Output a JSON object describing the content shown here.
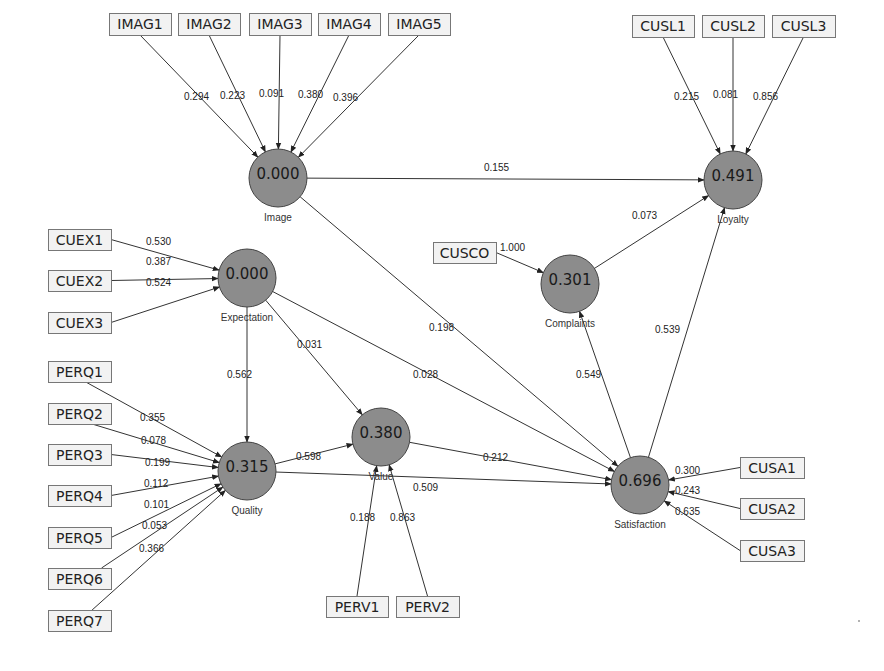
{
  "diagram": {
    "type": "PLS path model",
    "constructs": [
      {
        "id": "image",
        "label": "Image",
        "value": "0.000",
        "cx": 278,
        "cy": 178
      },
      {
        "id": "expectation",
        "label": "Expectation",
        "value": "0.000",
        "cx": 247,
        "cy": 278
      },
      {
        "id": "quality",
        "label": "Quality",
        "value": "0.315",
        "cx": 247,
        "cy": 471
      },
      {
        "id": "value",
        "label": "Value",
        "value": "0.380",
        "cx": 381,
        "cy": 437
      },
      {
        "id": "complaints",
        "label": "Complaints",
        "value": "0.301",
        "cx": 570,
        "cy": 284
      },
      {
        "id": "loyalty",
        "label": "Loyalty",
        "value": "0.491",
        "cx": 733,
        "cy": 180
      },
      {
        "id": "satisfaction",
        "label": "Satisfaction",
        "value": "0.696",
        "cx": 640,
        "cy": 485
      }
    ],
    "indicators": [
      {
        "id": "IMAG1",
        "label": "IMAG1",
        "x": 109,
        "y": 13,
        "w": 62,
        "h": 22,
        "construct": "image",
        "weight": "0.294",
        "lx": 184,
        "ly": 100
      },
      {
        "id": "IMAG2",
        "label": "IMAG2",
        "x": 178,
        "y": 13,
        "w": 62,
        "h": 22,
        "construct": "image",
        "weight": "0.223",
        "lx": 220,
        "ly": 99
      },
      {
        "id": "IMAG3",
        "label": "IMAG3",
        "x": 249,
        "y": 13,
        "w": 62,
        "h": 22,
        "construct": "image",
        "weight": "0.091",
        "lx": 259,
        "ly": 97
      },
      {
        "id": "IMAG4",
        "label": "IMAG4",
        "x": 318,
        "y": 13,
        "w": 62,
        "h": 22,
        "construct": "image",
        "weight": "0.380",
        "lx": 298,
        "ly": 98
      },
      {
        "id": "IMAG5",
        "label": "IMAG5",
        "x": 388,
        "y": 13,
        "w": 62,
        "h": 22,
        "construct": "image",
        "weight": "0.396",
        "lx": 333,
        "ly": 101
      },
      {
        "id": "CUSL1",
        "label": "CUSL1",
        "x": 632,
        "y": 15,
        "w": 62,
        "h": 22,
        "construct": "loyalty",
        "weight": "0.215",
        "lx": 674,
        "ly": 100
      },
      {
        "id": "CUSL2",
        "label": "CUSL2",
        "x": 702,
        "y": 15,
        "w": 62,
        "h": 22,
        "construct": "loyalty",
        "weight": "0.081",
        "lx": 713,
        "ly": 98
      },
      {
        "id": "CUSL3",
        "label": "CUSL3",
        "x": 772,
        "y": 15,
        "w": 63,
        "h": 22,
        "construct": "loyalty",
        "weight": "0.856",
        "lx": 753,
        "ly": 100
      },
      {
        "id": "CUEX1",
        "label": "CUEX1",
        "x": 48,
        "y": 229,
        "w": 63,
        "h": 21,
        "construct": "expectation",
        "weight": "0.530",
        "lx": 146,
        "ly": 245
      },
      {
        "id": "CUEX2",
        "label": "CUEX2",
        "x": 48,
        "y": 270,
        "w": 63,
        "h": 21,
        "construct": "expectation",
        "weight": "0.387",
        "lx": 146,
        "ly": 265
      },
      {
        "id": "CUEX3",
        "label": "CUEX3",
        "x": 48,
        "y": 312,
        "w": 63,
        "h": 21,
        "construct": "expectation",
        "weight": "0.524",
        "lx": 146,
        "ly": 286
      },
      {
        "id": "PERQ1",
        "label": "PERQ1",
        "x": 48,
        "y": 361,
        "w": 63,
        "h": 21,
        "construct": "quality",
        "weight": "0.355",
        "lx": 140,
        "ly": 421
      },
      {
        "id": "PERQ2",
        "label": "PERQ2",
        "x": 48,
        "y": 403,
        "w": 63,
        "h": 21,
        "construct": "quality",
        "weight": "0.078",
        "lx": 141,
        "ly": 444
      },
      {
        "id": "PERQ3",
        "label": "PERQ3",
        "x": 48,
        "y": 444,
        "w": 63,
        "h": 21,
        "construct": "quality",
        "weight": "0.199",
        "lx": 145,
        "ly": 466
      },
      {
        "id": "PERQ4",
        "label": "PERQ4",
        "x": 48,
        "y": 485,
        "w": 63,
        "h": 21,
        "construct": "quality",
        "weight": "0.112",
        "lx": 144,
        "ly": 487
      },
      {
        "id": "PERQ5",
        "label": "PERQ5",
        "x": 48,
        "y": 527,
        "w": 63,
        "h": 21,
        "construct": "quality",
        "weight": "0.101",
        "lx": 144,
        "ly": 508
      },
      {
        "id": "PERQ6",
        "label": "PERQ6",
        "x": 48,
        "y": 568,
        "w": 63,
        "h": 21,
        "construct": "quality",
        "weight": "0.053",
        "lx": 142,
        "ly": 529
      },
      {
        "id": "PERQ7",
        "label": "PERQ7",
        "x": 48,
        "y": 610,
        "w": 63,
        "h": 21,
        "construct": "quality",
        "weight": "0.366",
        "lx": 139,
        "ly": 552
      },
      {
        "id": "CUSCO",
        "label": "CUSCO",
        "x": 433,
        "y": 242,
        "w": 63,
        "h": 21,
        "construct": "complaints",
        "weight": "1.000",
        "lx": 500,
        "ly": 251
      },
      {
        "id": "PERV1",
        "label": "PERV1",
        "x": 326,
        "y": 596,
        "w": 62,
        "h": 21,
        "construct": "value",
        "weight": "0.188",
        "lx": 350,
        "ly": 521
      },
      {
        "id": "PERV2",
        "label": "PERV2",
        "x": 396,
        "y": 596,
        "w": 63,
        "h": 21,
        "construct": "value",
        "weight": "0.863",
        "lx": 390,
        "ly": 521
      },
      {
        "id": "CUSA1",
        "label": "CUSA1",
        "x": 740,
        "y": 457,
        "w": 64,
        "h": 21,
        "construct": "satisfaction",
        "weight": "0.300",
        "lx": 675,
        "ly": 474
      },
      {
        "id": "CUSA2",
        "label": "CUSA2",
        "x": 740,
        "y": 498,
        "w": 64,
        "h": 21,
        "construct": "satisfaction",
        "weight": "0.243",
        "lx": 675,
        "ly": 494
      },
      {
        "id": "CUSA3",
        "label": "CUSA3",
        "x": 740,
        "y": 540,
        "w": 64,
        "h": 21,
        "construct": "satisfaction",
        "weight": "0.635",
        "lx": 675,
        "ly": 515
      }
    ],
    "paths": [
      {
        "from": "image",
        "to": "loyalty",
        "coef": "0.155",
        "lx": 484,
        "ly": 171
      },
      {
        "from": "image",
        "to": "satisfaction",
        "coef": "0.198",
        "lx": 429,
        "ly": 331
      },
      {
        "from": "expectation",
        "to": "quality",
        "coef": "0.562",
        "lx": 227,
        "ly": 378
      },
      {
        "from": "expectation",
        "to": "value",
        "coef": "0.031",
        "lx": 297,
        "ly": 348
      },
      {
        "from": "expectation",
        "to": "satisfaction",
        "coef": "0.028",
        "lx": 413,
        "ly": 378
      },
      {
        "from": "quality",
        "to": "value",
        "coef": "0.598",
        "lx": 296,
        "ly": 460
      },
      {
        "from": "quality",
        "to": "satisfaction",
        "coef": "0.509",
        "lx": 413,
        "ly": 491
      },
      {
        "from": "value",
        "to": "satisfaction",
        "coef": "0.212",
        "lx": 483,
        "ly": 461
      },
      {
        "from": "satisfaction",
        "to": "complaints",
        "coef": "0.549",
        "lx": 576,
        "ly": 378
      },
      {
        "from": "satisfaction",
        "to": "loyalty",
        "coef": "0.539",
        "lx": 655,
        "ly": 333
      },
      {
        "from": "complaints",
        "to": "loyalty",
        "coef": "0.073",
        "lx": 632,
        "ly": 219
      }
    ]
  }
}
